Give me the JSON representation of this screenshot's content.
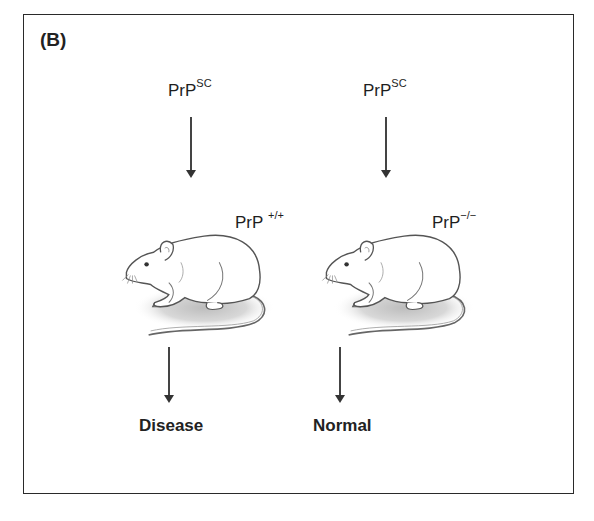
{
  "figure": {
    "panel_label": "(B)",
    "left_column": {
      "input_label": "PrP",
      "input_superscript": "SC",
      "genotype_label": "PrP",
      "genotype_superscript": "+/+",
      "outcome": "Disease"
    },
    "right_column": {
      "input_label": "PrP",
      "input_superscript": "SC",
      "genotype_label": "PrP",
      "genotype_superscript": "−/−",
      "outcome": "Normal"
    },
    "colors": {
      "frame": "#2a2a2a",
      "arrow": "#444444",
      "mouse_outline": "#555555",
      "shadow": "#c8c8c8"
    }
  }
}
